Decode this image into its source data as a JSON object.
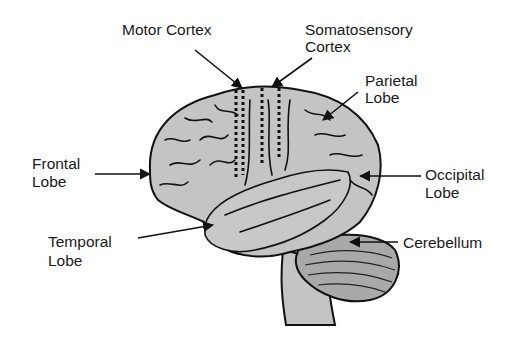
{
  "diagram": {
    "labels": {
      "motor_cortex": "Motor Cortex",
      "somatosensory_1": "Somatosensory",
      "somatosensory_2": "Cortex",
      "parietal_1": "Parietal",
      "parietal_2": "Lobe",
      "frontal_1": "Frontal",
      "frontal_2": "Lobe",
      "occipital_1": "Occipital",
      "occipital_2": "Lobe",
      "temporal_1": "Temporal",
      "temporal_2": "Lobe",
      "cerebellum": "Cerebellum"
    },
    "colors": {
      "brain_fill": "#c4c4c4",
      "outline": "#111111",
      "cerebellum_fill": "#a9a9a9",
      "background": "#ffffff"
    }
  }
}
